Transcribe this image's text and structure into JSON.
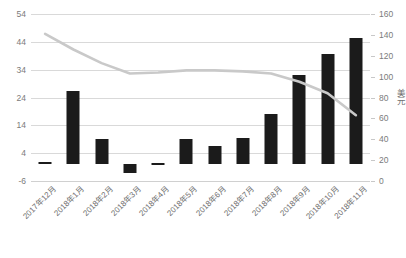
{
  "chart_data": {
    "type": "bar",
    "title": "",
    "subtitle": "",
    "xlabel": "",
    "ylabel": "",
    "ylabel_right": "美元",
    "grid": true,
    "legend": "none",
    "categories": [
      "2017年12月",
      "2018年1月",
      "2018年2月",
      "2018年3月",
      "2018年4月",
      "2018年5月",
      "2018年6月",
      "2018年7月",
      "2018年8月",
      "2018年9月",
      "2018年10月",
      "2018年11月"
    ],
    "ylim": [
      -6,
      54
    ],
    "yticks": [
      54,
      44,
      34,
      24,
      14,
      4,
      -6
    ],
    "ylim_right": [
      0,
      160
    ],
    "yticks_right": [
      160,
      140,
      120,
      100,
      80,
      60,
      40,
      20,
      0
    ],
    "series": [
      {
        "name": "bars",
        "chart_type": "bar",
        "axis": "left",
        "color": "#1b1b1b",
        "values": [
          1,
          26.5,
          9,
          -3,
          0.3,
          9,
          6.5,
          9.5,
          18,
          32,
          39.5,
          45.5
        ]
      },
      {
        "name": "line",
        "chart_type": "line",
        "axis": "right",
        "color": "#c9c9c9",
        "values": [
          141,
          126,
          113,
          103,
          104,
          106,
          106,
          105,
          103,
          95,
          84,
          63
        ]
      }
    ]
  }
}
